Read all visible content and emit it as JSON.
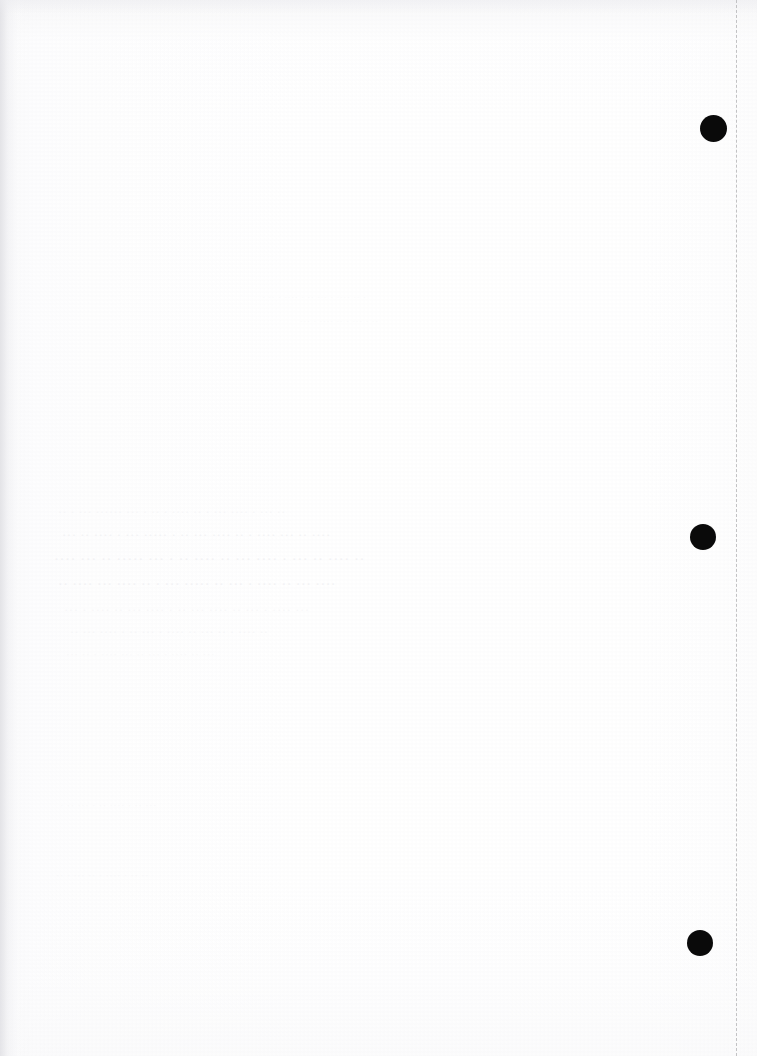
{
  "document": {
    "kind": "scanned-blank-page",
    "page_label": "",
    "visible_text": "",
    "background_color": "#fefefe",
    "width_px": 757,
    "height_px": 1056
  },
  "marks": {
    "punch_color": "#0a0a0a",
    "punch_marks": [
      {
        "id": "punch-mark-top",
        "cx": 713,
        "cy": 128,
        "d": 27
      },
      {
        "id": "punch-mark-middle",
        "cx": 703,
        "cy": 537,
        "d": 26
      },
      {
        "id": "punch-mark-bottom",
        "cx": 700,
        "cy": 943,
        "d": 26
      }
    ]
  },
  "trim_guide": {
    "color": "#c2c2c4",
    "x": 736,
    "top": 0,
    "height": 1056,
    "style": "dashed"
  },
  "bleed_through": {
    "note": "show-through from reverse side, illegible",
    "lines": [
      {
        "top": 292,
        "left": 262,
        "size": 9,
        "text": "· ·· · ···· · ·· ··· · ···· ·· ·",
        "class": "ghost-trace"
      },
      {
        "top": 316,
        "left": 300,
        "size": 9,
        "text": "··· · ···· ·· · ··· · ··",
        "class": "ghost-trace"
      },
      {
        "top": 505,
        "left": 58,
        "size": 12,
        "text": "·· · ··· ······ ··· · ·· · ···· ·· · ··· ···· · ··· ··",
        "class": "ghost-fainter"
      },
      {
        "top": 527,
        "left": 62,
        "size": 13,
        "text": "··· ·· ···· · ··· ····· · ·· ··· ···· ·· · ···· ··· ·· ····",
        "class": "ghost-faint"
      },
      {
        "top": 551,
        "left": 54,
        "size": 15,
        "text": "···· ··· ·· ····· ··· · ·· ···· ·· ··· ···· · ··· ·· ···· ··",
        "class": "ghost-faint"
      },
      {
        "top": 577,
        "left": 58,
        "size": 14,
        "text": "·· ···· ··· ···· ·· · ··· ····· ·· ··· · ···· ·· ··· ····",
        "class": "ghost-faint"
      },
      {
        "top": 602,
        "left": 64,
        "size": 13,
        "text": "··· · ···· ·· ··· ···· · ·· ··· ···· ·· ··· · ···· ···",
        "class": "ghost-fainter"
      },
      {
        "top": 625,
        "left": 70,
        "size": 12,
        "text": "·· ··· ···· · ·· ··· · ···· ·· ··· ·· · ···· ··",
        "class": "ghost-fainter"
      },
      {
        "top": 648,
        "left": 66,
        "size": 11,
        "text": "··· ·· · ···· ··· ·· ··· · ···· ·· ···",
        "class": "ghost-trace"
      },
      {
        "top": 800,
        "left": 60,
        "size": 10,
        "text": "· ·· ··· · ·· ···· · ·· ···",
        "class": "ghost-trace"
      },
      {
        "top": 870,
        "left": 56,
        "size": 10,
        "text": "·· · ··· ·· · ···· · ·· ··",
        "class": "ghost-trace"
      }
    ]
  }
}
